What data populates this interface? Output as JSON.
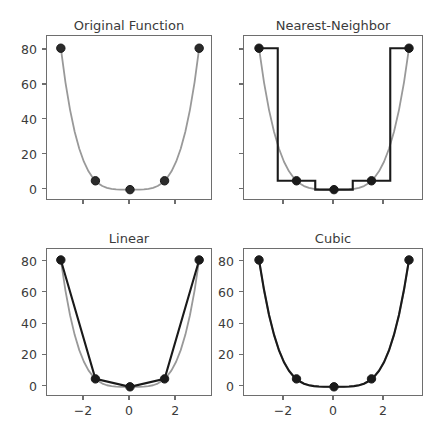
{
  "figure": {
    "background": "#ffffff",
    "axis_color": "#6e6e6e",
    "text_color": "#3b3b3b",
    "reference_curve_color": "#999999",
    "interp_curve_color": "#1a1a1a",
    "marker_color": "#1a1a1a"
  },
  "panels": [
    {
      "key": "original",
      "title": "Original Function",
      "show_ytick_labels": true,
      "show_xtick_labels": false
    },
    {
      "key": "nearest",
      "title": "Nearest-Neighbor",
      "show_ytick_labels": false,
      "show_xtick_labels": false
    },
    {
      "key": "linear",
      "title": "Linear",
      "show_ytick_labels": true,
      "show_xtick_labels": true
    },
    {
      "key": "cubic",
      "title": "Cubic",
      "show_ytick_labels": true,
      "show_xtick_labels": true
    }
  ],
  "chart_data": {
    "type": "line",
    "title": "",
    "subplot_grid": [
      2,
      2
    ],
    "xlabel": "",
    "ylabel": "",
    "xlim": [
      -3.6,
      3.6
    ],
    "ylim": [
      -6.5,
      88
    ],
    "xticks": [
      -2,
      0,
      2
    ],
    "xticklabels": [
      "−2",
      "0",
      "2"
    ],
    "yticks": [
      0,
      20,
      40,
      60,
      80
    ],
    "yticklabels": [
      "0",
      "20",
      "40",
      "60",
      "80"
    ],
    "grid": false,
    "legend": null,
    "samples": {
      "x": [
        -3,
        -1.5,
        0,
        1.5,
        3
      ],
      "y": [
        81,
        5.0625,
        0,
        5.0625,
        81
      ]
    },
    "reference_function": {
      "name": "x^4",
      "color": "#999999",
      "x": [
        -3,
        -2.8,
        -2.6,
        -2.4,
        -2.2,
        -2,
        -1.8,
        -1.6,
        -1.4,
        -1.2,
        -1,
        -0.8,
        -0.6,
        -0.4,
        -0.2,
        0,
        0.2,
        0.4,
        0.6,
        0.8,
        1,
        1.2,
        1.4,
        1.6,
        1.8,
        2,
        2.2,
        2.4,
        2.6,
        2.8,
        3
      ],
      "y": [
        81,
        61.47,
        45.7,
        33.18,
        23.43,
        16,
        10.5,
        6.55,
        3.84,
        2.07,
        1,
        0.41,
        0.13,
        0.026,
        0.0016,
        0,
        0.0016,
        0.026,
        0.13,
        0.41,
        1,
        2.07,
        3.84,
        6.55,
        10.5,
        16,
        23.43,
        33.18,
        45.7,
        61.47,
        81
      ]
    },
    "series": [
      {
        "name": "Original Function",
        "panel": "original",
        "kind": "smooth",
        "color": "#999999",
        "x": [
          -3,
          -2.8,
          -2.6,
          -2.4,
          -2.2,
          -2,
          -1.8,
          -1.6,
          -1.4,
          -1.2,
          -1,
          -0.8,
          -0.6,
          -0.4,
          -0.2,
          0,
          0.2,
          0.4,
          0.6,
          0.8,
          1,
          1.2,
          1.4,
          1.6,
          1.8,
          2,
          2.2,
          2.4,
          2.6,
          2.8,
          3
        ],
        "y": [
          81,
          61.47,
          45.7,
          33.18,
          23.43,
          16,
          10.5,
          6.55,
          3.84,
          2.07,
          1,
          0.41,
          0.13,
          0.026,
          0.0016,
          0,
          0.0016,
          0.026,
          0.13,
          0.41,
          1,
          2.07,
          3.84,
          6.55,
          10.5,
          16,
          23.43,
          33.18,
          45.7,
          61.47,
          81
        ]
      },
      {
        "name": "Nearest-Neighbor",
        "panel": "nearest",
        "kind": "step",
        "color": "#1a1a1a",
        "x": [
          -3,
          -2.25,
          -2.25,
          -0.75,
          -0.75,
          0.75,
          0.75,
          2.25,
          2.25,
          3
        ],
        "y": [
          81,
          81,
          5.0625,
          5.0625,
          0,
          0,
          5.0625,
          5.0625,
          81,
          81
        ]
      },
      {
        "name": "Linear",
        "panel": "linear",
        "kind": "polyline",
        "color": "#1a1a1a",
        "x": [
          -3,
          -1.5,
          0,
          1.5,
          3
        ],
        "y": [
          81,
          5.0625,
          0,
          5.0625,
          81
        ]
      },
      {
        "name": "Cubic",
        "panel": "cubic",
        "kind": "smooth",
        "color": "#1a1a1a",
        "x": [
          -3,
          -2.8,
          -2.6,
          -2.4,
          -2.2,
          -2,
          -1.8,
          -1.6,
          -1.4,
          -1.2,
          -1,
          -0.8,
          -0.6,
          -0.4,
          -0.2,
          0,
          0.2,
          0.4,
          0.6,
          0.8,
          1,
          1.2,
          1.4,
          1.6,
          1.8,
          2,
          2.2,
          2.4,
          2.6,
          2.8,
          3
        ],
        "y": [
          81,
          62.1,
          46.0,
          33.3,
          23.2,
          15.6,
          10.1,
          6.3,
          3.7,
          2.0,
          1.0,
          0.45,
          0.17,
          0.05,
          0.01,
          0,
          0.01,
          0.05,
          0.17,
          0.45,
          1.0,
          2.0,
          3.7,
          6.3,
          10.1,
          15.6,
          23.2,
          33.3,
          46.0,
          62.1,
          81
        ]
      }
    ]
  },
  "geometry": {
    "panel_boxes": [
      {
        "key": "original",
        "left": 46,
        "top": 35,
        "width": 166,
        "height": 165
      },
      {
        "key": "nearest",
        "left": 243,
        "top": 35,
        "width": 180,
        "height": 165
      },
      {
        "key": "linear",
        "left": 46,
        "top": 248,
        "width": 166,
        "height": 148
      },
      {
        "key": "cubic",
        "left": 243,
        "top": 248,
        "width": 180,
        "height": 148
      }
    ],
    "title_tops": [
      18,
      18,
      231,
      231
    ]
  }
}
